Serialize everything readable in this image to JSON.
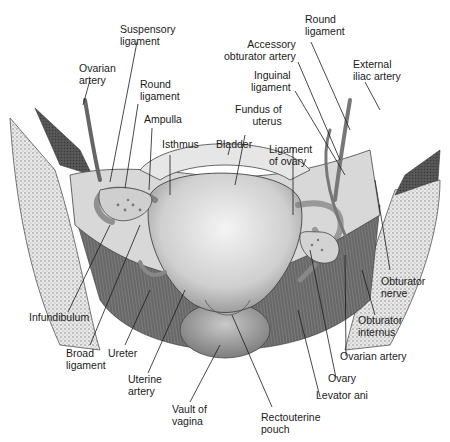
{
  "figure": {
    "type": "anatomical-illustration"
  },
  "labels": {
    "suspensory_ligament": "Suspensory\nligament",
    "ovarian_artery_left": "Ovarian\nartery",
    "round_ligament_left": "Round\nligament",
    "ampulla": "Ampulla",
    "isthmus": "Isthmus",
    "bladder": "Bladder",
    "fundus_of_uterus": "Fundus of\nuterus",
    "ligament_of_ovary": "Ligament\nof ovary",
    "inguinal_ligament": "Inguinal\nligament",
    "accessory_obturator_artery": "Accessory\nobturator artery",
    "round_ligament_right": "Round\nligament",
    "external_iliac_artery": "External\niliac artery",
    "infundibulum": "Infundibulum",
    "broad_ligament": "Broad\nligament",
    "ureter": "Ureter",
    "uterine_artery": "Uterine\nartery",
    "vault_of_vagina": "Vault of\nvagina",
    "rectouterine_pouch": "Rectouterine\npouch",
    "levator_ani": "Levator ani",
    "ovary": "Ovary",
    "ovarian_artery_right": "Ovarian artery",
    "obturator_internus": "Obturator\ninternus",
    "obturator_nerve": "Obturator\nnerve"
  },
  "colors": {
    "ink": "#1a1a1a",
    "tissue_light": "#dcdcdc",
    "tissue_mid": "#a9a9a9",
    "tissue_dark": "#5e5e5e",
    "bone_stipple": "#8a8a8a"
  }
}
